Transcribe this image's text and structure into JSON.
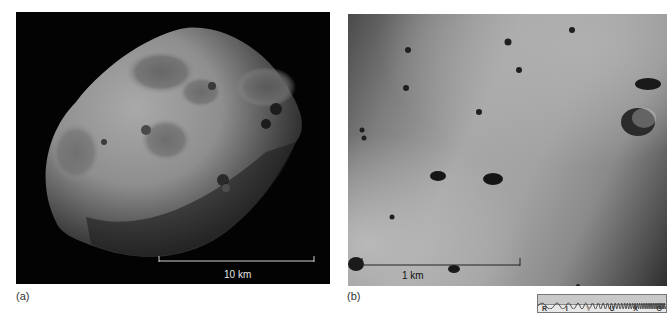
{
  "panels": [
    {
      "id": "a",
      "label": "(a)",
      "subject": "irregular cratered moon (Phobos) against black space",
      "scale_bar": {
        "text": "10 km"
      }
    },
    {
      "id": "b",
      "label": "(b)",
      "subject": "close-up of cratered surface",
      "scale_bar": {
        "text": "1 km"
      }
    }
  ],
  "spectrum": {
    "bands": [
      "R",
      "I",
      "V",
      "U",
      "X",
      "G"
    ],
    "highlighted": "V"
  },
  "colors": {
    "background": "#ffffff",
    "space": "#030303",
    "surface_light": "#a8a8a8",
    "surface_dark": "#4a4a4a"
  }
}
